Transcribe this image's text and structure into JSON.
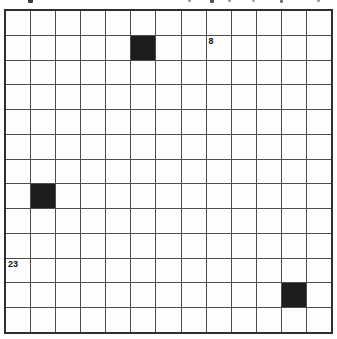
{
  "puzzle": {
    "grid": {
      "rows": 13,
      "cols": 13,
      "black_cells": [
        [
          1,
          5
        ],
        [
          7,
          1
        ],
        [
          11,
          11
        ]
      ],
      "numbers": [
        {
          "row": 1,
          "col": 8,
          "label": "8"
        },
        {
          "row": 10,
          "col": 0,
          "label": "23"
        }
      ]
    },
    "colors": {
      "background": "#ffffff",
      "cell_fill": "#fdfdfd",
      "grid_line": "#4d4d4d",
      "outer_border": "#2f2f2f",
      "black_cell": "#1d1d1d",
      "number_text": "#111111"
    },
    "cropped_text_marks": [
      {
        "x": 28,
        "w": 5,
        "h": 3,
        "color": "#3a3a3a"
      },
      {
        "x": 188,
        "w": 3,
        "h": 2,
        "color": "#9a9a9a"
      },
      {
        "x": 210,
        "w": 4,
        "h": 3,
        "color": "#555555"
      },
      {
        "x": 228,
        "w": 3,
        "h": 2,
        "color": "#9a9a9a"
      },
      {
        "x": 252,
        "w": 3,
        "h": 2,
        "color": "#aaaaaa"
      },
      {
        "x": 280,
        "w": 3,
        "h": 3,
        "color": "#777777"
      },
      {
        "x": 317,
        "w": 3,
        "h": 2,
        "color": "#9a9a9a"
      }
    ]
  }
}
